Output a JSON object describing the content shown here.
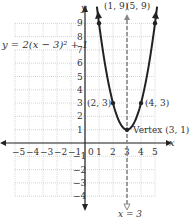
{
  "chart_data": {
    "type": "line",
    "title": "",
    "equation_label": "y = 2(x − 3)² + 1",
    "xlabel": "x",
    "ylabel": "y",
    "xlim": [
      -5,
      5
    ],
    "ylim": [
      -4,
      9
    ],
    "grid": true,
    "x_ticks": [
      "−5",
      "−4",
      "−3",
      "−2",
      "−1",
      "0",
      "1",
      "2",
      "3",
      "4",
      "5"
    ],
    "y_ticks": [
      "−4",
      "−3",
      "−2",
      "−1",
      "1",
      "2",
      "3",
      "4",
      "5",
      "6",
      "7",
      "8",
      "9"
    ],
    "series": [
      {
        "name": "y = 2(x − 3)² + 1",
        "x": [
          1,
          1.5,
          2,
          2.5,
          3,
          3.5,
          4,
          4.5,
          5
        ],
        "values": [
          9,
          5.5,
          3,
          1.5,
          1,
          1.5,
          3,
          5.5,
          9
        ]
      }
    ],
    "axis_of_symmetry": {
      "label": "x = 3",
      "x": 3,
      "style": "dashed"
    },
    "points": [
      {
        "label": "(1, 9)",
        "x": 1,
        "y": 9
      },
      {
        "label": "(5, 9)",
        "x": 5,
        "y": 9
      },
      {
        "label": "(2, 3)",
        "x": 2,
        "y": 3
      },
      {
        "label": "(4, 3)",
        "x": 4,
        "y": 3
      },
      {
        "label": "Vertex (3, 1)",
        "x": 3,
        "y": 1
      }
    ]
  },
  "colors": {
    "curve": "#222222",
    "grid": "#bbbbbb",
    "axis": "#222222",
    "symmetry": "#888888"
  }
}
